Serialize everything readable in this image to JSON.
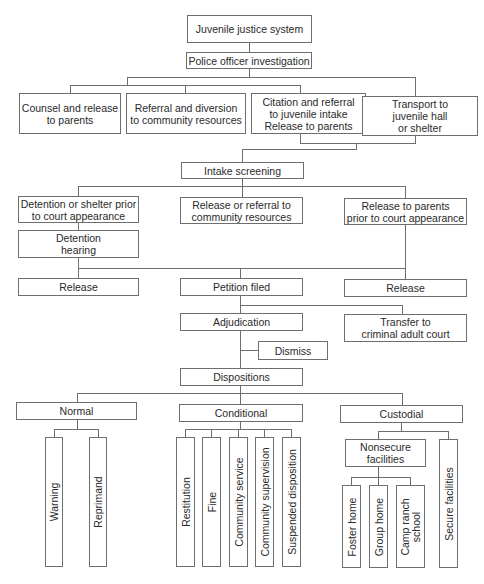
{
  "diagram": {
    "type": "flowchart",
    "title": "Juvenile justice system",
    "nodes": {
      "root": "Juvenile justice system",
      "police": "Police officer investigation",
      "counsel": "Counsel and release\nto parents",
      "referral_diversion": "Referral and diversion\nto community resources",
      "citation": "Citation and referral\nto juvenile intake\nRelease to parents",
      "transport": "Transport to\njuvenile hall\nor shelter",
      "intake": "Intake screening",
      "detention_shelter": "Detention or shelter prior\nto court appearance",
      "release_referral": "Release or referral to\ncommunity resources",
      "release_parents": "Release to parents\nprior to court appearance",
      "detention_hearing": "Detention\nhearing",
      "release_left": "Release",
      "petition": "Petition filed",
      "release_right": "Release",
      "adjudication": "Adjudication",
      "transfer": "Transfer to\ncriminal adult court",
      "dismiss": "Dismiss",
      "dispositions": "Dispositions",
      "normal": "Normal",
      "conditional": "Conditional",
      "custodial": "Custodial",
      "warning": "Warning",
      "reprimand": "Reprimand",
      "restitution": "Restitution",
      "fine": "Fine",
      "community_service": "Community service",
      "community_supervision": "Community supervision",
      "suspended_disposition": "Suspended disposition",
      "nonsecure": "Nonsecure\nfacilities",
      "secure": "Secure facilities",
      "foster_home": "Foster home",
      "group_home": "Group home",
      "camp_ranch": "Camp ranch\nschool"
    },
    "edges": [
      [
        "root",
        "police"
      ],
      [
        "police",
        "counsel"
      ],
      [
        "police",
        "referral_diversion"
      ],
      [
        "police",
        "citation"
      ],
      [
        "police",
        "transport"
      ],
      [
        "citation",
        "intake"
      ],
      [
        "transport",
        "intake"
      ],
      [
        "intake",
        "detention_shelter"
      ],
      [
        "intake",
        "release_referral"
      ],
      [
        "intake",
        "release_parents"
      ],
      [
        "detention_shelter",
        "detention_hearing"
      ],
      [
        "detention_hearing",
        "release_left"
      ],
      [
        "detention_hearing",
        "petition"
      ],
      [
        "release_parents",
        "petition"
      ],
      [
        "release_parents",
        "release_right"
      ],
      [
        "petition",
        "adjudication"
      ],
      [
        "petition",
        "transfer"
      ],
      [
        "adjudication",
        "dismiss"
      ],
      [
        "adjudication",
        "dispositions"
      ],
      [
        "dispositions",
        "normal"
      ],
      [
        "dispositions",
        "conditional"
      ],
      [
        "dispositions",
        "custodial"
      ],
      [
        "normal",
        "warning"
      ],
      [
        "normal",
        "reprimand"
      ],
      [
        "conditional",
        "restitution"
      ],
      [
        "conditional",
        "fine"
      ],
      [
        "conditional",
        "community_service"
      ],
      [
        "conditional",
        "community_supervision"
      ],
      [
        "conditional",
        "suspended_disposition"
      ],
      [
        "custodial",
        "nonsecure"
      ],
      [
        "custodial",
        "secure"
      ],
      [
        "nonsecure",
        "foster_home"
      ],
      [
        "nonsecure",
        "group_home"
      ],
      [
        "nonsecure",
        "camp_ranch"
      ]
    ],
    "colors": {
      "line": "#6e6e6e",
      "text": "#2a2a2a",
      "background": "#ffffff"
    }
  }
}
